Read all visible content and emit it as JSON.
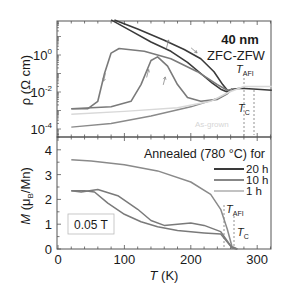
{
  "chart_data": [
    {
      "panel": "top",
      "type": "line",
      "ylabel": "ρ (Ω cm)",
      "yscale": "log",
      "ylim_log10": [
        -4.4,
        1.8
      ],
      "yticks": [
        {
          "exp": 0,
          "label": "10",
          "sup": "0"
        },
        {
          "exp": -2,
          "label": "10",
          "sup": "-2"
        },
        {
          "exp": -4,
          "label": "10",
          "sup": "-4"
        }
      ],
      "xlim": [
        0,
        322
      ],
      "annotations": {
        "title1": "40 nm",
        "title2": "ZFC-ZFW",
        "t_afi": "T",
        "t_afi_sub": "AFI",
        "t_c": "T",
        "t_c_sub": "C",
        "as_grown": "As-grown"
      },
      "series": [
        {
          "name": "20 h cooling",
          "color": "#3a3a3a",
          "width": 1.6,
          "points": [
            [
              80,
              1.9
            ],
            [
              110,
              1.3
            ],
            [
              140,
              0.7
            ],
            [
              170,
              0.2
            ],
            [
              195,
              -0.4
            ],
            [
              215,
              -1.0
            ],
            [
              232,
              -1.5
            ],
            [
              245,
              -1.85
            ],
            [
              255,
              -2.0
            ],
            [
              262,
              -1.85
            ],
            [
              275,
              -1.8
            ],
            [
              300,
              -1.85
            ],
            [
              322,
              -1.9
            ]
          ]
        },
        {
          "name": "20 h warming",
          "color": "#3a3a3a",
          "width": 1.6,
          "points": [
            [
              85,
              1.9
            ],
            [
              120,
              1.4
            ],
            [
              160,
              0.8
            ],
            [
              190,
              0.3
            ],
            [
              215,
              -0.2
            ],
            [
              235,
              -0.9
            ],
            [
              248,
              -1.6
            ],
            [
              256,
              -1.95
            ],
            [
              262,
              -1.85
            ]
          ]
        },
        {
          "name": "10 h cooling",
          "color": "#7a7a7a",
          "width": 1.6,
          "points": [
            [
              20,
              -2.9
            ],
            [
              45,
              -2.9
            ],
            [
              60,
              -2.5
            ],
            [
              70,
              -1.0
            ],
            [
              80,
              0.1
            ],
            [
              92,
              0.35
            ],
            [
              130,
              0.2
            ],
            [
              170,
              -0.2
            ],
            [
              210,
              -0.9
            ],
            [
              240,
              -1.6
            ],
            [
              255,
              -1.9
            ],
            [
              262,
              -1.85
            ]
          ]
        },
        {
          "name": "10 h warming",
          "color": "#7a7a7a",
          "width": 1.6,
          "points": [
            [
              20,
              -2.9
            ],
            [
              80,
              -2.8
            ],
            [
              110,
              -2.5
            ],
            [
              125,
              -1.6
            ],
            [
              140,
              -0.3
            ],
            [
              150,
              -0.1
            ],
            [
              165,
              -0.6
            ],
            [
              180,
              -1.6
            ],
            [
              195,
              -2.3
            ],
            [
              215,
              -2.5
            ],
            [
              240,
              -2.4
            ],
            [
              255,
              -2.1
            ],
            [
              262,
              -1.85
            ]
          ]
        },
        {
          "name": "1 h",
          "color": "#8a8a8a",
          "width": 1.4,
          "points": [
            [
              20,
              -3.9
            ],
            [
              80,
              -3.7
            ],
            [
              140,
              -3.3
            ],
            [
              200,
              -2.8
            ],
            [
              240,
              -2.35
            ],
            [
              258,
              -2.0
            ],
            [
              262,
              -1.85
            ]
          ]
        },
        {
          "name": "As-grown",
          "color": "#d8d8d8",
          "width": 1.4,
          "points": [
            [
              20,
              -3.2
            ],
            [
              100,
              -3.05
            ],
            [
              180,
              -2.85
            ],
            [
              230,
              -2.5
            ],
            [
              258,
              -2.0
            ],
            [
              280,
              -1.7
            ],
            [
              322,
              -1.7
            ]
          ]
        }
      ],
      "arrows": [
        {
          "x": 70,
          "y": -1.2,
          "dir": "down"
        },
        {
          "x": 135,
          "y": -1.0,
          "dir": "up"
        },
        {
          "x": 160,
          "y": -1.4,
          "dir": "up"
        },
        {
          "x": 165,
          "y": 0.6,
          "dir": "up"
        },
        {
          "x": 205,
          "y": 0.25,
          "dir": "down-right"
        }
      ]
    },
    {
      "panel": "bottom",
      "type": "line",
      "xlabel": "T (K)",
      "ylabel": "M (μB/Mn)",
      "xlim": [
        0,
        322
      ],
      "ylim": [
        0,
        4.5
      ],
      "xticks": [
        0,
        100,
        200,
        300
      ],
      "yticks": [
        0,
        1,
        2,
        3,
        4
      ],
      "title": "Annealed (780 °C) for",
      "field_label": "0.05 T",
      "annotations": {
        "t_afi": "T",
        "t_afi_sub": "AFI",
        "t_c": "T",
        "t_c_sub": "C"
      },
      "legend": [
        {
          "label": "20 h",
          "color": "#3a3a3a",
          "width": 2.0
        },
        {
          "label": "10 h",
          "color": "#7a7a7a",
          "width": 1.8
        },
        {
          "label": "1  h",
          "color": "#9a9a9a",
          "width": 1.2
        }
      ],
      "series": [
        {
          "name": "1 h",
          "color": "#8a8a8a",
          "width": 1.5,
          "points": [
            [
              20,
              3.6
            ],
            [
              50,
              3.55
            ],
            [
              100,
              3.4
            ],
            [
              150,
              3.15
            ],
            [
              200,
              2.7
            ],
            [
              230,
              2.2
            ],
            [
              245,
              1.6
            ],
            [
              255,
              0.8
            ],
            [
              262,
              0.1
            ],
            [
              270,
              0.0
            ]
          ]
        },
        {
          "name": "10 h (upper)",
          "color": "#7a7a7a",
          "width": 1.5,
          "points": [
            [
              20,
              2.35
            ],
            [
              35,
              2.3
            ],
            [
              60,
              2.4
            ],
            [
              90,
              2.15
            ],
            [
              120,
              1.6
            ],
            [
              140,
              1.15
            ],
            [
              160,
              0.95
            ],
            [
              180,
              1.0
            ],
            [
              200,
              1.05
            ],
            [
              220,
              0.95
            ],
            [
              245,
              0.7
            ],
            [
              262,
              0.05
            ],
            [
              270,
              0.0
            ]
          ]
        },
        {
          "name": "10 h (lower)",
          "color": "#7a7a7a",
          "width": 1.5,
          "points": [
            [
              20,
              2.35
            ],
            [
              40,
              2.35
            ],
            [
              55,
              2.3
            ],
            [
              75,
              1.85
            ],
            [
              100,
              1.4
            ],
            [
              125,
              1.1
            ],
            [
              150,
              0.9
            ],
            [
              180,
              0.75
            ],
            [
              220,
              0.65
            ],
            [
              245,
              0.6
            ],
            [
              262,
              0.05
            ],
            [
              270,
              0.0
            ]
          ]
        }
      ]
    }
  ]
}
